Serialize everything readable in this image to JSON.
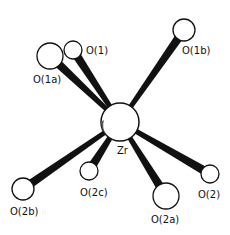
{
  "diagram": {
    "type": "molecular-coordination-structure",
    "center_atom": {
      "label": "Zr",
      "x": 120,
      "y": 122,
      "r": 19
    },
    "atoms": [
      {
        "id": "O1a",
        "label": "O(1a)",
        "x": 50,
        "y": 56,
        "r": 13,
        "lx": 33,
        "ly": 83
      },
      {
        "id": "O1",
        "label": "O(1)",
        "x": 73,
        "y": 50,
        "r": 9,
        "lx": 86,
        "ly": 54
      },
      {
        "id": "O1b",
        "label": "O(1b)",
        "x": 184,
        "y": 30,
        "r": 11,
        "lx": 182,
        "ly": 54
      },
      {
        "id": "O2c",
        "label": "O(2c)",
        "x": 89,
        "y": 171,
        "r": 9,
        "lx": 80,
        "ly": 196
      },
      {
        "id": "O2b",
        "label": "O(2b)",
        "x": 23,
        "y": 189,
        "r": 11,
        "lx": 10,
        "ly": 215
      },
      {
        "id": "O2a",
        "label": "O(2a)",
        "x": 166,
        "y": 196,
        "r": 13,
        "lx": 151,
        "ly": 223
      },
      {
        "id": "O2",
        "label": "O(2)",
        "x": 210,
        "y": 174,
        "r": 9,
        "lx": 198,
        "ly": 198
      }
    ],
    "zr_label": {
      "text": "Zr",
      "x": 117,
      "y": 154
    }
  }
}
